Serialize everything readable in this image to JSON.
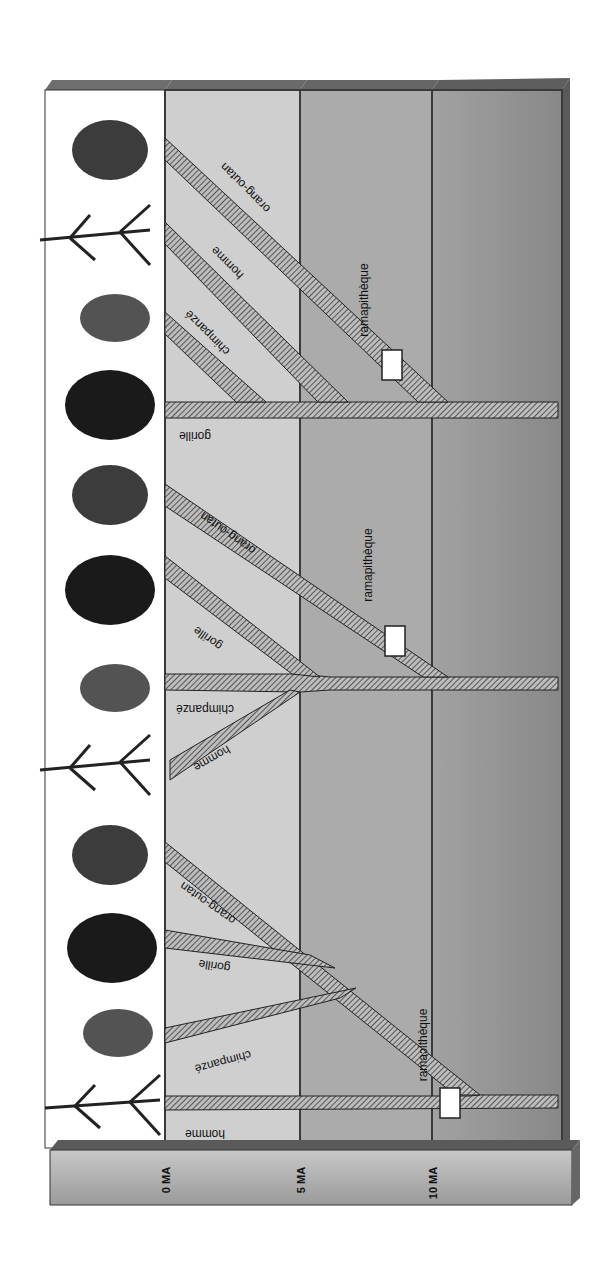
{
  "diagram": {
    "title": "",
    "orientation": "rotated 90° — time axis runs left-to-right, labels read bottom-to-top",
    "time_axis": {
      "ticks": [
        {
          "label": "0 MA",
          "x": 165
        },
        {
          "label": "5 MA",
          "x": 300
        },
        {
          "label": "10 MA",
          "x": 432
        }
      ]
    },
    "band_colors": {
      "figures_column": "#ffffff",
      "band_0_5": "#cfcfcf",
      "band_5_10": "#a9a9a9",
      "band_10_plus": "#959595",
      "axis_bar": "#b0b0b0",
      "frame_top": "#6e6e6e",
      "branch_fill": "#8a8a8a"
    },
    "hypotheses": [
      {
        "id": "hypothesis-1",
        "stem_label": "gorille",
        "branches": [
          {
            "label": "orang-outan"
          },
          {
            "label": "homme"
          },
          {
            "label": "chimpanzé"
          }
        ],
        "fossil_label": "ramapithèque",
        "figures": [
          "orang-outan",
          "homme",
          "chimpanzé",
          "gorille"
        ]
      },
      {
        "id": "hypothesis-2",
        "stem_label": "chimpanzé",
        "branches": [
          {
            "label": "orang-outan"
          },
          {
            "label": "gorille"
          },
          {
            "label": "homme"
          }
        ],
        "fossil_label": "ramapithèque",
        "figures": [
          "orang-outan",
          "gorille",
          "chimpanzé",
          "homme"
        ]
      },
      {
        "id": "hypothesis-3",
        "stem_label": "homme",
        "branches": [
          {
            "label": "orang-outan"
          },
          {
            "label": "gorille"
          },
          {
            "label": "chimpanzé"
          }
        ],
        "fossil_label": "ramaɔithèque",
        "figures": [
          "orang-outan",
          "gorille",
          "chimpanzé",
          "homme"
        ]
      }
    ]
  }
}
